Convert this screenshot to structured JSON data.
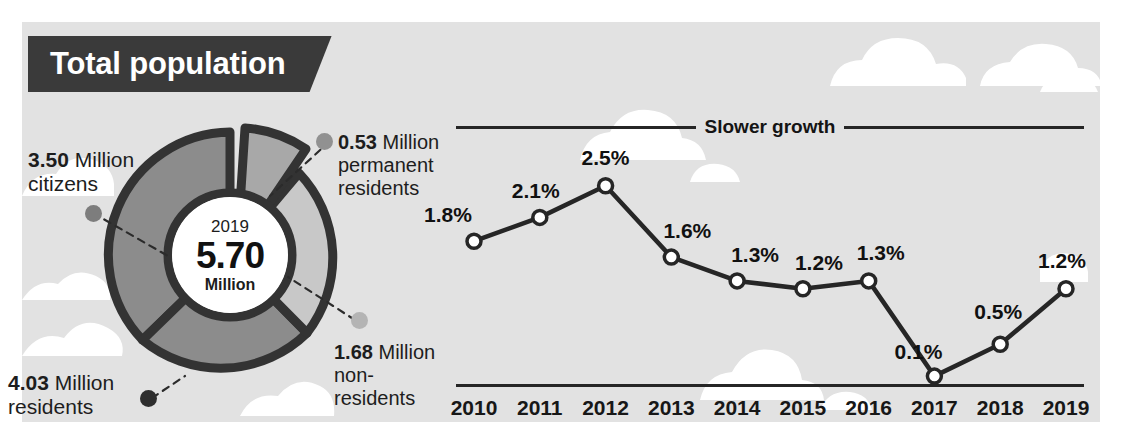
{
  "background": {
    "sky_color": "#e2e2e2",
    "cloud_color": "#ffffff",
    "page_color": "#ffffff"
  },
  "header": {
    "ribbon_label": "Total population",
    "ribbon_bg": "#3a3a3a",
    "ribbon_text_color": "#ffffff"
  },
  "donut": {
    "center_year": "2019",
    "center_value": "5.70",
    "center_unit": "Million",
    "segments": [
      {
        "key": "citizens",
        "value": 3.5,
        "unit": "Million",
        "label": "citizens",
        "color": "#8c8c8c",
        "dot_color": "#7d7d7d"
      },
      {
        "key": "permanent",
        "value": 0.53,
        "unit": "Million",
        "label": "permanent residents",
        "color": "#a8a8a8",
        "dot_color": "#919191"
      },
      {
        "key": "nonres",
        "value": 1.68,
        "unit": "Million",
        "label": "non-residents",
        "color": "#c8c8c8",
        "dot_color": "#b4b4b4"
      }
    ],
    "callouts": {
      "citizens": {
        "num": "3.50",
        "unit": "Million",
        "line2": "citizens"
      },
      "permanent": {
        "num": "0.53",
        "unit": "Million",
        "line2": "permanent",
        "line3": "residents"
      },
      "residents": {
        "num": "4.03",
        "unit": "Million",
        "line2": "residents",
        "dot_color": "#2e2e2e"
      },
      "nonres": {
        "num": "1.68",
        "unit": "Million",
        "line2": "non-",
        "line3": "residents"
      }
    },
    "outline_color": "#333333"
  },
  "chart_data": {
    "type": "line",
    "title": "Slower growth",
    "xlabel": "",
    "ylabel": "",
    "categories": [
      "2010",
      "2011",
      "2012",
      "2013",
      "2014",
      "2015",
      "2016",
      "2017",
      "2018",
      "2019"
    ],
    "values": [
      1.8,
      2.1,
      2.5,
      1.6,
      1.3,
      1.2,
      1.3,
      0.1,
      0.5,
      1.2
    ],
    "point_labels": [
      "1.8%",
      "2.1%",
      "2.5%",
      "1.6%",
      "1.3%",
      "1.2%",
      "1.3%",
      "0.1%",
      "0.5%",
      "1.2%"
    ],
    "ylim": [
      0,
      2.9
    ],
    "unit": "%",
    "grid": false,
    "legend": false,
    "line_color": "#262626",
    "marker_fill": "#ffffff",
    "marker_stroke": "#262626"
  }
}
